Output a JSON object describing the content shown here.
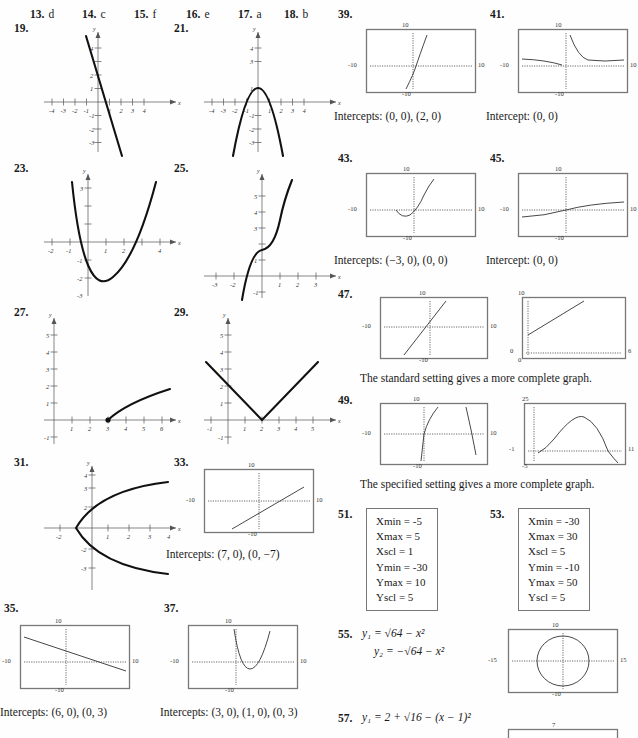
{
  "matching_row": {
    "items": [
      {
        "num": "13.",
        "answer": "d"
      },
      {
        "num": "14.",
        "answer": "c"
      },
      {
        "num": "15.",
        "answer": "f"
      },
      {
        "num": "16.",
        "answer": "e"
      },
      {
        "num": "17.",
        "answer": "a"
      },
      {
        "num": "18.",
        "answer": "b"
      }
    ]
  },
  "left_column": {
    "problems": [
      {
        "num": "19.",
        "kind": "cartesian",
        "xticks": [
          "-4",
          "-3",
          "-2",
          "-1",
          "1",
          "2",
          "3",
          "4"
        ],
        "yticks": [
          "1",
          "2",
          "3",
          "4",
          "-1",
          "-2",
          "-3",
          "-4"
        ],
        "axis_x": "x",
        "axis_y": "y"
      },
      {
        "num": "21.",
        "kind": "cartesian",
        "xticks": [
          "-4",
          "-3",
          "-2",
          "-1",
          "1",
          "2",
          "3",
          "4"
        ],
        "yticks": [
          "1",
          "3",
          "4",
          "-1",
          "-2",
          "-3",
          "-4"
        ],
        "axis_x": "x",
        "axis_y": "y"
      },
      {
        "num": "23.",
        "kind": "cartesian",
        "xticks": [
          "-2",
          "-1",
          "1",
          "2",
          "4"
        ],
        "yticks": [
          "3",
          "-1",
          "-2",
          "-3"
        ],
        "axis_x": "x",
        "axis_y": "y"
      },
      {
        "num": "25.",
        "kind": "cartesian",
        "xticks": [
          "-3",
          "-2",
          "1",
          "2",
          "3"
        ],
        "yticks": [
          "1",
          "3",
          "4",
          "5",
          "6",
          "-1"
        ],
        "axis_x": "x",
        "axis_y": "y"
      },
      {
        "num": "27.",
        "kind": "cartesian",
        "xticks": [
          "1",
          "2",
          "3",
          "4",
          "5",
          "6"
        ],
        "yticks": [
          "1",
          "2",
          "3",
          "4",
          "5",
          "-1"
        ],
        "axis_x": "x",
        "axis_y": "y"
      },
      {
        "num": "29.",
        "kind": "cartesian",
        "xticks": [
          "-1",
          "1",
          "2",
          "3",
          "4",
          "5"
        ],
        "yticks": [
          "1",
          "2",
          "3",
          "4",
          "5",
          "-1"
        ],
        "axis_x": "x",
        "axis_y": "y"
      },
      {
        "num": "31.",
        "kind": "cartesian",
        "xticks": [
          "-2",
          "1",
          "2",
          "3",
          "4"
        ],
        "yticks": [
          "2",
          "3",
          "4",
          "-2",
          "-3"
        ],
        "axis_x": "x",
        "axis_y": "y"
      },
      {
        "num": "33.",
        "kind": "calculator",
        "top": "10",
        "bottom": "-10",
        "left": "-10",
        "right": "10",
        "caption": "Intercepts:  (7, 0), (0, −7)"
      },
      {
        "num": "35.",
        "kind": "calculator",
        "top": "10",
        "bottom": "-10",
        "left": "-10",
        "right": "10",
        "caption": "Intercepts:  (6, 0), (0, 3)"
      },
      {
        "num": "37.",
        "kind": "calculator",
        "top": "10",
        "bottom": "-10",
        "left": "-10",
        "right": "10",
        "caption": "Intercepts:  (3, 0), (1, 0), (0, 3)"
      }
    ]
  },
  "right_column": {
    "problems": [
      {
        "num": "39.",
        "kind": "calculator",
        "top": "10",
        "bottom": "-10",
        "left": "-10",
        "right": "10",
        "caption": "Intercepts:  (0, 0), (2, 0)"
      },
      {
        "num": "41.",
        "kind": "calculator",
        "top": "10",
        "bottom": "-10",
        "left": "-10",
        "right": "10",
        "caption": "Intercept:  (0, 0)"
      },
      {
        "num": "43.",
        "kind": "calculator",
        "top": "10",
        "bottom": "-10",
        "left": "-10",
        "right": "10",
        "caption": "Intercepts:  (−3, 0), (0, 0)"
      },
      {
        "num": "45.",
        "kind": "calculator",
        "top": "10",
        "bottom": "-10",
        "left": "-10",
        "right": "10",
        "caption": "Intercept:  (0, 0)"
      },
      {
        "num": "47.",
        "kind": "calculator_pair",
        "graph_a": {
          "top": "10",
          "bottom": "-10",
          "left": "-10",
          "right": "10"
        },
        "graph_b": {
          "top": "10",
          "bottom": "0",
          "left": "0",
          "right": "6"
        },
        "caption": "The standard setting gives a more complete graph."
      },
      {
        "num": "49.",
        "kind": "calculator_pair",
        "graph_a": {
          "top": "10",
          "bottom": "-10",
          "left": "-10",
          "right": "10"
        },
        "graph_b": {
          "top": "25",
          "bottom": "-5",
          "left": "-1",
          "right": "11"
        },
        "caption": "The specified setting gives a more complete graph."
      },
      {
        "num": "51.",
        "kind": "window",
        "settings": [
          "Xmin = -5",
          "Xmax = 5",
          "Xscl = 1",
          "Ymin = -30",
          "Ymax = 10",
          "Yscl = 5"
        ]
      },
      {
        "num": "53.",
        "kind": "window",
        "settings": [
          "Xmin = -30",
          "Xmax = 30",
          "Xscl = 5",
          "Ymin = -10",
          "Ymax = 50",
          "Yscl = 5"
        ]
      },
      {
        "num": "55.",
        "kind": "equations_with_graph",
        "eq1_prefix": "y",
        "eq1_sub": "1",
        "eq1_body": "= √64 − x²",
        "eq2_prefix": "y",
        "eq2_sub": "2",
        "eq2_body": "= −√64 − x²",
        "graph": {
          "top": "10",
          "bottom": "-10",
          "left": "-15",
          "right": "15"
        }
      },
      {
        "num": "57.",
        "kind": "equations_with_graph",
        "eq1_prefix": "y",
        "eq1_sub": "1",
        "eq1_body": "= 2 + √16 − (x − 1)²",
        "graph": {
          "top": "7"
        }
      }
    ]
  }
}
